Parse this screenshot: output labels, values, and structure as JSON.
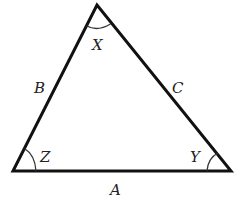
{
  "diagram": {
    "type": "triangle",
    "vertices": {
      "top": {
        "x": 97,
        "y": 5
      },
      "bottom_left": {
        "x": 13,
        "y": 171
      },
      "bottom_right": {
        "x": 231,
        "y": 171
      }
    },
    "angle_labels": {
      "top": "X",
      "bottom_left": "Z",
      "bottom_right": "Y"
    },
    "side_labels": {
      "left": "B",
      "right": "C",
      "bottom": "A"
    },
    "colors": {
      "stroke": "#111111",
      "arc": "#333333",
      "text": "#222222",
      "background": "#ffffff"
    }
  }
}
